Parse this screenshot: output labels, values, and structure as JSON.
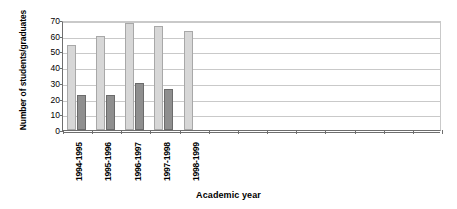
{
  "chart_data": {
    "type": "bar",
    "title": "",
    "xlabel": "Academic year",
    "ylabel": "Number of students/graduates",
    "categories": [
      "1994-1995",
      "1995-1996",
      "1996-1997",
      "1997-1998",
      "1998-1999"
    ],
    "empty_category_slots": 8,
    "series": [
      {
        "name": "students",
        "color": "#d7d7d7",
        "values": [
          54,
          60,
          68,
          66,
          63
        ]
      },
      {
        "name": "graduates",
        "color": "#8f8f8f",
        "values": [
          22,
          22,
          30,
          26,
          null
        ]
      }
    ],
    "ylim": [
      0,
      70
    ],
    "ytick_values": [
      0,
      10,
      20,
      30,
      40,
      50,
      60,
      70
    ],
    "ytick_labels": [
      "0",
      "10",
      "20",
      "30",
      "40",
      "50",
      "60",
      "70"
    ],
    "grid": true,
    "grid_axis": "y",
    "legend": "none",
    "plot_border_color": "#c9c9c9",
    "axis_color": "#6e6e6e",
    "background": "#ffffff"
  }
}
